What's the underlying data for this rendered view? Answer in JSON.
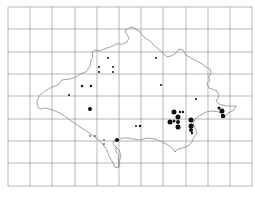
{
  "map": {
    "type": "distribution-map",
    "background": "#ffffff",
    "grid": {
      "color": "#9a9a9a",
      "x_lines": [
        8,
        30,
        52,
        75,
        97,
        119,
        141,
        163,
        186,
        208,
        230,
        252
      ],
      "y_lines": [
        7,
        29,
        52,
        74,
        96,
        119,
        141,
        163,
        186
      ]
    },
    "outline_color": "#8a8a8a",
    "dot_color": "#111111",
    "records": [
      {
        "x": 108,
        "y": 58,
        "r": 1.0
      },
      {
        "x": 99,
        "y": 67,
        "r": 1.0
      },
      {
        "x": 113,
        "y": 67,
        "r": 1.0
      },
      {
        "x": 99,
        "y": 72,
        "r": 1.0
      },
      {
        "x": 113,
        "y": 72,
        "r": 1.0
      },
      {
        "x": 156,
        "y": 58,
        "r": 1.0
      },
      {
        "x": 82,
        "y": 86,
        "r": 1.2
      },
      {
        "x": 91,
        "y": 86,
        "r": 1.2
      },
      {
        "x": 161,
        "y": 85,
        "r": 1.0
      },
      {
        "x": 69,
        "y": 95,
        "r": 1.0
      },
      {
        "x": 196,
        "y": 99,
        "r": 1.0
      },
      {
        "x": 90,
        "y": 109,
        "r": 2.0
      },
      {
        "x": 136,
        "y": 126,
        "r": 1.0
      },
      {
        "x": 140,
        "y": 126,
        "r": 1.2
      },
      {
        "x": 90,
        "y": 136,
        "r": 0.8
      },
      {
        "x": 95,
        "y": 136,
        "r": 0.8
      },
      {
        "x": 104,
        "y": 140,
        "r": 0.8
      },
      {
        "x": 104,
        "y": 144,
        "r": 0.8
      },
      {
        "x": 117,
        "y": 140,
        "r": 2.0
      },
      {
        "x": 174,
        "y": 112,
        "r": 2.5
      },
      {
        "x": 180,
        "y": 112,
        "r": 1.2
      },
      {
        "x": 183,
        "y": 112,
        "r": 1.2
      },
      {
        "x": 178,
        "y": 117,
        "r": 2.5
      },
      {
        "x": 174,
        "y": 121,
        "r": 1.5
      },
      {
        "x": 170,
        "y": 122,
        "r": 2.5
      },
      {
        "x": 178,
        "y": 122,
        "r": 2.0
      },
      {
        "x": 178,
        "y": 127,
        "r": 2.5
      },
      {
        "x": 191,
        "y": 120,
        "r": 2.5
      },
      {
        "x": 191,
        "y": 126,
        "r": 2.5
      },
      {
        "x": 191,
        "y": 130,
        "r": 2.0
      },
      {
        "x": 192,
        "y": 133,
        "r": 1.2
      },
      {
        "x": 219,
        "y": 108,
        "r": 1.5
      },
      {
        "x": 222,
        "y": 111,
        "r": 2.5
      },
      {
        "x": 223,
        "y": 116,
        "r": 2.2
      }
    ]
  }
}
